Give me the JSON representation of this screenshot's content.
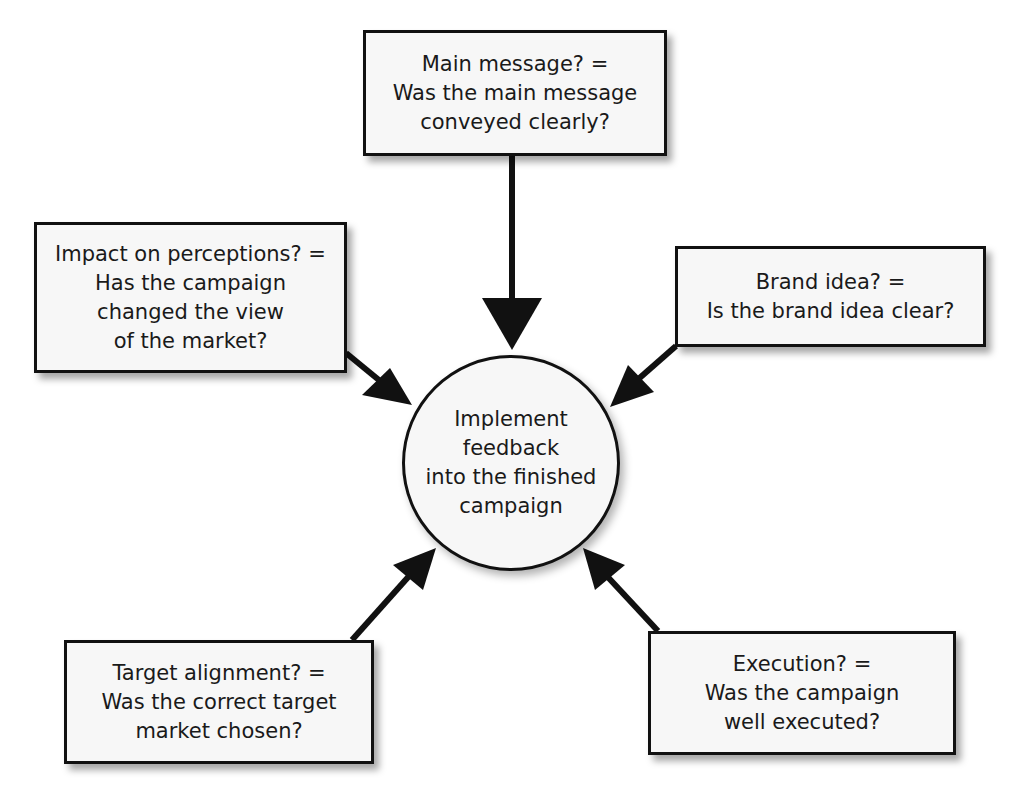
{
  "diagram": {
    "center": {
      "lines": [
        "Implement",
        "feedback",
        "into the finished",
        "campaign"
      ]
    },
    "nodes": {
      "main_message": {
        "lines": [
          "Main message? =",
          "Was the main message",
          "conveyed clearly?"
        ]
      },
      "impact": {
        "lines": [
          "Impact on perceptions? =",
          "Has the campaign",
          "changed the view",
          "of the market?"
        ]
      },
      "brand_idea": {
        "lines": [
          "Brand idea? =",
          "Is the brand idea clear?"
        ]
      },
      "target": {
        "lines": [
          "Target alignment? =",
          "Was the correct target",
          "market chosen?"
        ]
      },
      "execution": {
        "lines": [
          "Execution? =",
          "Was the campaign",
          "well executed?"
        ]
      }
    },
    "edges": [
      {
        "from": "main_message",
        "to": "center"
      },
      {
        "from": "impact",
        "to": "center"
      },
      {
        "from": "brand_idea",
        "to": "center"
      },
      {
        "from": "target",
        "to": "center"
      },
      {
        "from": "execution",
        "to": "center"
      }
    ],
    "colors": {
      "stroke": "#111111",
      "fill": "#f7f7f7"
    }
  }
}
